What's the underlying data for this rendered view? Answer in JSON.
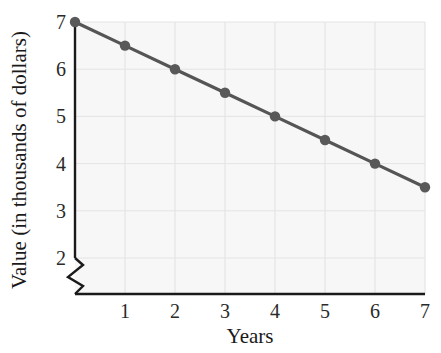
{
  "chart_data": {
    "type": "line",
    "title": "",
    "subtitle": "",
    "xlabel": "Years",
    "ylabel": "Value (in thousands of dollars)",
    "x": [
      0,
      1,
      2,
      3,
      4,
      5,
      6,
      7
    ],
    "values": [
      7,
      6.5,
      6,
      5.5,
      5,
      4.5,
      4,
      3.5
    ],
    "series": [
      {
        "name": "Value",
        "values": [
          7,
          6.5,
          6,
          5.5,
          5,
          4.5,
          4,
          3.5
        ]
      }
    ],
    "xlim": [
      0,
      7
    ],
    "ylim": [
      2,
      7
    ],
    "xticks": [
      1,
      2,
      3,
      4,
      5,
      6,
      7
    ],
    "yticks": [
      2,
      3,
      4,
      5,
      6,
      7
    ],
    "xtick_labels": [
      "1",
      "2",
      "3",
      "4",
      "5",
      "6",
      "7"
    ],
    "ytick_labels": [
      "2",
      "3",
      "4",
      "5",
      "6",
      "7"
    ],
    "grid": true,
    "grid_color": "#e4e4e4",
    "legend": false,
    "legend_position": "none",
    "axis_break": "y-axis zigzag break below 2",
    "line_color": "#555555",
    "marker_color": "#595959",
    "plot_background": "#f7f7f7",
    "annotations": []
  },
  "axes": {
    "x_label": "Years",
    "y_label": "Value (in thousands of dollars)",
    "x_ticks": [
      {
        "label": "1",
        "value": 1
      },
      {
        "label": "2",
        "value": 2
      },
      {
        "label": "3",
        "value": 3
      },
      {
        "label": "4",
        "value": 4
      },
      {
        "label": "5",
        "value": 5
      },
      {
        "label": "6",
        "value": 6
      },
      {
        "label": "7",
        "value": 7
      }
    ],
    "y_ticks": [
      {
        "label": "7",
        "value": 7
      },
      {
        "label": "6",
        "value": 6
      },
      {
        "label": "5",
        "value": 5
      },
      {
        "label": "4",
        "value": 4
      },
      {
        "label": "3",
        "value": 3
      },
      {
        "label": "2",
        "value": 2
      }
    ]
  },
  "colors": {
    "axis": "#1a1a1a",
    "grid": "#e6e6e6",
    "series": "#555555",
    "marker": "#5a5a5a",
    "text": "#1a1a1a",
    "plot_bg": "#f7f7f7"
  }
}
